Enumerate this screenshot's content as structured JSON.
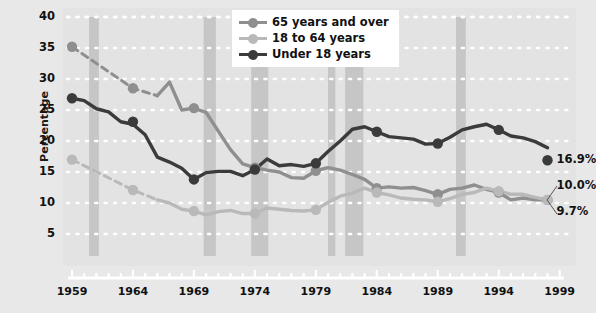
{
  "chart_data": {
    "type": "line",
    "title": "",
    "xlabel": "",
    "ylabel": "Percentage",
    "xlim": [
      1959,
      1999
    ],
    "ylim": [
      0,
      42
    ],
    "grid": true,
    "legend_position": "top-center",
    "x": [
      1959,
      1960,
      1961,
      1962,
      1963,
      1964,
      1965,
      1966,
      1967,
      1968,
      1969,
      1970,
      1971,
      1972,
      1973,
      1974,
      1975,
      1976,
      1977,
      1978,
      1979,
      1980,
      1981,
      1982,
      1983,
      1984,
      1985,
      1986,
      1987,
      1988,
      1989,
      1990,
      1991,
      1992,
      1993,
      1994,
      1995,
      1996,
      1997,
      1998
    ],
    "series": [
      {
        "name": "65 years and over",
        "color": "#8f8f8f",
        "dashed_until": 1966,
        "values": [
          35.2,
          null,
          null,
          null,
          null,
          28.5,
          null,
          27.3,
          29.5,
          25.0,
          25.3,
          24.6,
          21.6,
          18.6,
          16.3,
          15.7,
          15.3,
          15.0,
          14.1,
          14.0,
          15.2,
          15.7,
          15.3,
          14.6,
          13.8,
          12.4,
          12.6,
          12.4,
          12.5,
          12.0,
          11.4,
          12.2,
          12.4,
          12.9,
          12.2,
          11.7,
          10.5,
          10.8,
          10.5,
          10.5
        ],
        "markers": [
          {
            "x": 1959,
            "y": 35.2
          },
          {
            "x": 1964,
            "y": 28.5
          },
          {
            "x": 1969,
            "y": 25.3
          },
          {
            "x": 1974,
            "y": 15.7
          },
          {
            "x": 1979,
            "y": 15.2
          },
          {
            "x": 1984,
            "y": 12.4
          },
          {
            "x": 1989,
            "y": 11.4
          },
          {
            "x": 1994,
            "y": 11.7
          },
          {
            "x": 1998,
            "y": 10.5
          }
        ],
        "end_label": "10.0%"
      },
      {
        "name": "18 to 64 years",
        "color": "#b9b9b9",
        "dashed_until": 1966,
        "values": [
          17.0,
          null,
          null,
          null,
          null,
          12.1,
          null,
          10.5,
          10.0,
          9.0,
          8.7,
          8.1,
          8.6,
          8.8,
          8.3,
          8.3,
          9.2,
          9.0,
          8.8,
          8.7,
          8.9,
          10.1,
          11.1,
          11.6,
          12.4,
          11.7,
          11.3,
          10.8,
          10.6,
          10.5,
          10.2,
          10.7,
          11.4,
          11.7,
          12.4,
          11.9,
          11.4,
          11.4,
          10.9,
          10.5
        ],
        "markers": [
          {
            "x": 1959,
            "y": 17.0
          },
          {
            "x": 1964,
            "y": 12.1
          },
          {
            "x": 1969,
            "y": 8.7
          },
          {
            "x": 1974,
            "y": 8.3
          },
          {
            "x": 1979,
            "y": 8.9
          },
          {
            "x": 1984,
            "y": 11.7
          },
          {
            "x": 1989,
            "y": 10.2
          },
          {
            "x": 1994,
            "y": 11.9
          },
          {
            "x": 1998,
            "y": 10.5
          }
        ],
        "end_label": "9.7%"
      },
      {
        "name": "Under 18 years",
        "color": "#3b3b3b",
        "dashed_until": null,
        "values": [
          26.9,
          26.5,
          25.2,
          24.7,
          23.1,
          22.7,
          21.0,
          17.4,
          16.6,
          15.6,
          13.8,
          14.9,
          15.1,
          15.1,
          14.4,
          15.4,
          17.1,
          16.0,
          16.2,
          15.9,
          16.4,
          18.3,
          20.0,
          21.9,
          22.3,
          21.5,
          20.7,
          20.5,
          20.3,
          19.5,
          19.6,
          20.6,
          21.8,
          22.3,
          22.7,
          21.8,
          20.8,
          20.5,
          19.9,
          18.9
        ],
        "markers": [
          {
            "x": 1959,
            "y": 26.9
          },
          {
            "x": 1964,
            "y": 23.1
          },
          {
            "x": 1969,
            "y": 13.8
          },
          {
            "x": 1974,
            "y": 15.4
          },
          {
            "x": 1979,
            "y": 16.4
          },
          {
            "x": 1984,
            "y": 21.5
          },
          {
            "x": 1989,
            "y": 19.6
          },
          {
            "x": 1994,
            "y": 21.8
          },
          {
            "x": 1998,
            "y": 16.9
          }
        ],
        "end_label": "16.9%"
      }
    ],
    "recession_bands": [
      {
        "start": 1960.4,
        "end": 1961.2
      },
      {
        "start": 1969.8,
        "end": 1970.8
      },
      {
        "start": 1973.7,
        "end": 1975.1
      },
      {
        "start": 1980.0,
        "end": 1980.6
      },
      {
        "start": 1981.4,
        "end": 1982.9
      },
      {
        "start": 1990.5,
        "end": 1991.3
      }
    ],
    "y_ticks": [
      5,
      10,
      15,
      20,
      25,
      30,
      35,
      40
    ],
    "x_ticks": [
      1959,
      1964,
      1969,
      1974,
      1979,
      1984,
      1989,
      1994,
      1999
    ]
  },
  "legend": {
    "items": [
      {
        "label": "65 years and over",
        "color": "#8f8f8f"
      },
      {
        "label": "18 to 64 years",
        "color": "#b9b9b9"
      },
      {
        "label": "Under 18 years",
        "color": "#3b3b3b"
      }
    ]
  },
  "axis": {
    "y_title": "Percentage",
    "y_ticks": [
      "40",
      "35",
      "30",
      "25",
      "20",
      "15",
      "10",
      "5"
    ],
    "x_ticks": [
      "1959",
      "1964",
      "1969",
      "1974",
      "1979",
      "1984",
      "1989",
      "1994",
      "1999"
    ]
  },
  "end_labels": {
    "under18": "16.9%",
    "over65": "10.0%",
    "adults": "9.7%"
  },
  "colors": {
    "background": "#e8e8e8",
    "plot_background": "#e3e3e3",
    "recession_band": "#c6c6c6",
    "gridline": "#ffffff",
    "axis_line": "#ffffff",
    "series_over65": "#8f8f8f",
    "series_18to64": "#b9b9b9",
    "series_under18": "#3b3b3b",
    "text": "#111111"
  }
}
